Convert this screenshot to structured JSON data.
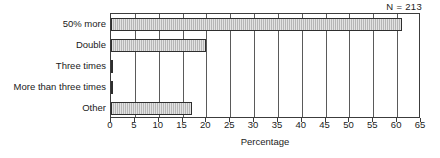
{
  "chart_data": {
    "type": "bar",
    "orientation": "horizontal",
    "title": "",
    "subtitle": "",
    "xlabel": "Percentage",
    "ylabel": "",
    "categories": [
      "50% more",
      "Double",
      "Three times",
      "More than three times",
      "Other"
    ],
    "values": [
      61,
      20,
      0.5,
      0.5,
      17
    ],
    "series": [
      {
        "name": "Percentage",
        "values": [
          61,
          20,
          0.5,
          0.5,
          17
        ]
      }
    ],
    "xlim": [
      0,
      65
    ],
    "ylim": null,
    "xticks": [
      0,
      5,
      10,
      15,
      20,
      25,
      30,
      35,
      40,
      45,
      50,
      55,
      60,
      65
    ],
    "xticklabels": [
      "0",
      "5",
      "10",
      "15",
      "20",
      "25",
      "30",
      "35",
      "40",
      "45",
      "50",
      "55",
      "60",
      "65"
    ],
    "grid": true,
    "grid_axis": "x",
    "legend": false,
    "legend_position": "none",
    "annotations": [
      {
        "text": "N = 213",
        "position": "top-right"
      }
    ],
    "bar_fill_color": "#b6b6b6",
    "bar_edge_color": "#2e2e2e",
    "axis_color": "#3c3c3c",
    "background_color": "#ffffff"
  },
  "annotation": {
    "sample_size_label": "N = 213"
  },
  "axis": {
    "x_title": "Percentage"
  }
}
